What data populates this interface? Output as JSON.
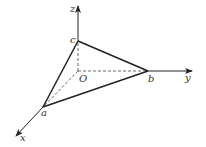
{
  "diagram": {
    "type": "3d-coordinate-triangle",
    "axes": {
      "x": {
        "label": "x"
      },
      "y": {
        "label": "y"
      },
      "z": {
        "label": "z"
      }
    },
    "origin": {
      "label": "O"
    },
    "points": {
      "a": {
        "label": "a",
        "on_axis": "x"
      },
      "b": {
        "label": "b",
        "on_axis": "y"
      },
      "c": {
        "label": "c",
        "on_axis": "z"
      }
    },
    "solid_edges": [
      "a-b",
      "b-c",
      "c-a"
    ],
    "dashed_edges": [
      "O-a",
      "O-b",
      "O-c"
    ],
    "colors": {
      "line": "#222222",
      "text": "#333333"
    }
  }
}
